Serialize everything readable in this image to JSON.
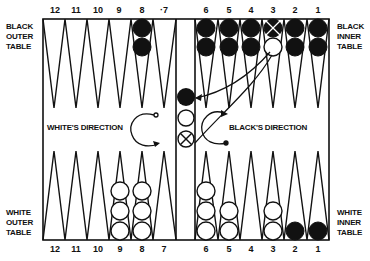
{
  "labels": {
    "black_outer_table": [
      "BLACK",
      "OUTER",
      "TABLE"
    ],
    "black_inner_table": [
      "BLACK",
      "INNER",
      "TABLE"
    ],
    "white_outer_table": [
      "WHITE",
      "OUTER",
      "TABLE"
    ],
    "white_inner_table": [
      "WHITE",
      "INNER",
      "TABLE"
    ],
    "white_direction": "WHITE'S DIRECTION",
    "black_direction": "BLACK'S DIRECTION"
  },
  "point_numbers": {
    "top": [
      "12",
      "11",
      "10",
      "9",
      "8",
      "·7",
      "6",
      "5",
      "4",
      "3",
      "2",
      "1"
    ],
    "bottom": [
      "12",
      "11",
      "10",
      "9",
      "8",
      "7",
      "6",
      "5",
      "4",
      "3",
      "2",
      "1"
    ]
  },
  "checkers": {
    "top": [
      {
        "point": "8",
        "color": "black",
        "count": 2
      },
      {
        "point": "6",
        "color": "black",
        "count": 2
      },
      {
        "point": "5",
        "color": "black",
        "count": 2
      },
      {
        "point": "4",
        "color": "black",
        "count": 2
      },
      {
        "point": "3",
        "color": "black",
        "count": 1,
        "note": "black checker crossed out, with white checker below"
      },
      {
        "point": "2",
        "color": "black",
        "count": 2
      },
      {
        "point": "1",
        "color": "black",
        "count": 2
      }
    ],
    "bottom": [
      {
        "point": "9",
        "color": "white",
        "count": 3
      },
      {
        "point": "8",
        "color": "white",
        "count": 3
      },
      {
        "point": "6",
        "color": "white",
        "count": 3
      },
      {
        "point": "5",
        "color": "white",
        "count": 2
      },
      {
        "point": "3",
        "color": "white",
        "count": 2
      },
      {
        "point": "2",
        "color": "black",
        "count": 1
      },
      {
        "point": "1",
        "color": "black",
        "count": 1
      }
    ],
    "bar": [
      "black",
      "white",
      "crossed-white"
    ]
  },
  "colors": {
    "ink": "#111111",
    "paper": "#ffffff"
  }
}
